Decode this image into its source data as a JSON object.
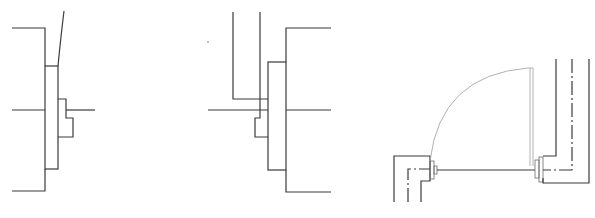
{
  "figure": {
    "panels": [
      {
        "id": "detail-a",
        "description": "Door frame section detail with jamb and stop on right side"
      },
      {
        "id": "detail-b",
        "description": "Door frame section detail with jamb and stop on left side"
      },
      {
        "id": "detail-c",
        "description": "Plan view of door opening with swing arc and jambs"
      }
    ],
    "colors": {
      "line": "#3a3a3a",
      "arc": "#a8a8a8",
      "background": "#ffffff"
    }
  }
}
